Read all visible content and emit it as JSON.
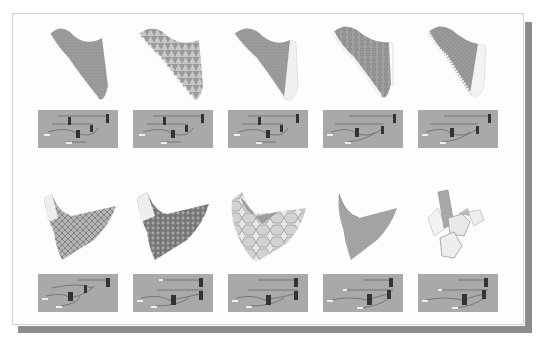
{
  "panel": {
    "layout": "2 rows x 5 columns",
    "description": "Parametric surface variations with corresponding node definition diagrams"
  },
  "colors": {
    "surface": "#9a9a9a",
    "surface_dark": "#7e7e7e",
    "edge_light": "#f2f2f2",
    "diagram_bg": "#a9a9a9",
    "diagram_wire": "#5f5f5f",
    "diagram_node": "#3a3a3a",
    "shadow": "#8d8d8d"
  },
  "rows": [
    {
      "id": "row-1",
      "cells": [
        {
          "render": "s-curve surface, fine grid",
          "pattern": "grid"
        },
        {
          "render": "s-curve surface, triangulated cells",
          "pattern": "triangles"
        },
        {
          "render": "s-curve surface, thick edge",
          "pattern": "plain"
        },
        {
          "render": "s-curve surface, hexagonal mesh",
          "pattern": "hex"
        },
        {
          "render": "s-curve surface, folded strips",
          "pattern": "strips"
        }
      ]
    },
    {
      "id": "row-2",
      "cells": [
        {
          "render": "saddle surface, diamond lattice",
          "pattern": "diamond"
        },
        {
          "render": "saddle surface, dense diamond lattice",
          "pattern": "diamond-dense"
        },
        {
          "render": "saddle surface, large hexagon cells",
          "pattern": "hex-large"
        },
        {
          "render": "saddle surface, fine weave",
          "pattern": "weave"
        },
        {
          "render": "saddle surface, voronoi cells",
          "pattern": "voronoi"
        }
      ]
    }
  ]
}
